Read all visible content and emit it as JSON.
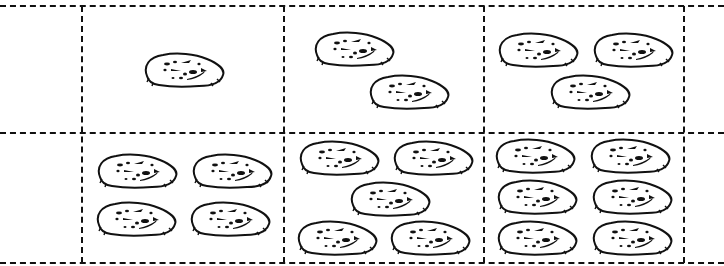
{
  "worksheet": {
    "title": "",
    "grid": {
      "columns_x": [
        82,
        284,
        484,
        684
      ],
      "rows_y": [
        6,
        133,
        263
      ],
      "line_color": "#111111",
      "line_style": "dashed"
    },
    "cells": [
      {
        "id": "cell-1",
        "count": 1,
        "cookies": [
          [
            184,
            70
          ]
        ]
      },
      {
        "id": "cell-2",
        "count": 2,
        "cookies": [
          [
            354,
            49
          ],
          [
            409,
            92
          ]
        ]
      },
      {
        "id": "cell-3",
        "count": 3,
        "cookies": [
          [
            538,
            50
          ],
          [
            633,
            50
          ],
          [
            590,
            92
          ]
        ]
      },
      {
        "id": "cell-4",
        "count": 4,
        "cookies": [
          [
            137,
            171
          ],
          [
            232,
            171
          ],
          [
            136,
            219
          ],
          [
            230,
            219
          ]
        ]
      },
      {
        "id": "cell-5",
        "count": 5,
        "cookies": [
          [
            339,
            158
          ],
          [
            433,
            158
          ],
          [
            390,
            199
          ],
          [
            337,
            238
          ],
          [
            430,
            238
          ]
        ]
      },
      {
        "id": "cell-6",
        "count": 6,
        "cookies": [
          [
            535,
            156
          ],
          [
            630,
            156
          ],
          [
            537,
            197
          ],
          [
            632,
            197
          ],
          [
            537,
            238
          ],
          [
            632,
            238
          ]
        ]
      }
    ],
    "cookie_icon": "cookie-icon"
  }
}
